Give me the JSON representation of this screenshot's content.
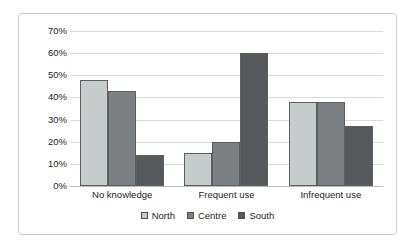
{
  "chart_data": {
    "type": "bar",
    "title": "",
    "subtitle": "",
    "xlabel": "",
    "ylabel": "",
    "categories": [
      "No knowledge",
      "Frequent use",
      "Infrequent use"
    ],
    "series": [
      {
        "name": "North",
        "color": "#c6cbcb",
        "values": [
          48,
          15,
          38
        ]
      },
      {
        "name": "Centre",
        "color": "#7d8083",
        "values": [
          43,
          20,
          38
        ]
      },
      {
        "name": "South",
        "color": "#55595c",
        "values": [
          14,
          60,
          27
        ]
      }
    ],
    "ylim": [
      0,
      70
    ],
    "ytick_values": [
      0,
      10,
      20,
      30,
      40,
      50,
      60,
      70
    ],
    "ytick_labels": [
      "0%",
      "10%",
      "20%",
      "30%",
      "40%",
      "50%",
      "60%",
      "70%"
    ],
    "value_suffix": "%",
    "grid": true,
    "grid_axis": "y",
    "legend_position": "bottom",
    "legend_entries": [
      "North",
      "Centre",
      "South"
    ],
    "border": true,
    "background_color": "#ffffff",
    "grid_color": "#d8dbdd",
    "border_color": "#c9ccd1",
    "text_color": "#231f20"
  }
}
